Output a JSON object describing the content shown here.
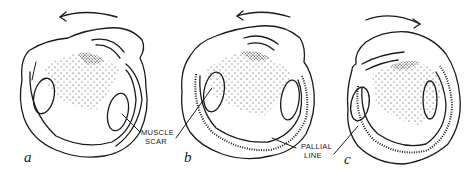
{
  "figure": {
    "panels": [
      {
        "letter": "a",
        "rotation": "counter-clockwise"
      },
      {
        "letter": "b",
        "rotation": "counter-clockwise"
      },
      {
        "letter": "c",
        "rotation": "clockwise"
      }
    ],
    "labels": {
      "muscle_scar_line1": "MUSCLE",
      "muscle_scar_line2": "SCAR",
      "pallial_line_line1": "PALLIAL",
      "pallial_line_line2": "LINE"
    }
  }
}
